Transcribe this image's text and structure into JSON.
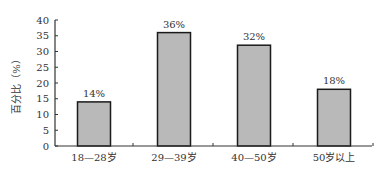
{
  "chart_data": {
    "type": "bar",
    "title": "",
    "xlabel": "",
    "ylabel": "百分比（%）",
    "ylim": [
      0,
      40
    ],
    "yticks": [
      0,
      5,
      10,
      15,
      20,
      25,
      30,
      35,
      40
    ],
    "grid": false,
    "legend": null,
    "categories": [
      "18—28岁",
      "29—39岁",
      "40—50岁",
      "50岁以上"
    ],
    "values": [
      14,
      36,
      32,
      18
    ],
    "value_labels": [
      "14%",
      "36%",
      "32%",
      "18%"
    ],
    "colors": {
      "bar_fill": "#b9b9b9",
      "bar_stroke": "#1a1a1a",
      "axis": "#333333"
    }
  }
}
